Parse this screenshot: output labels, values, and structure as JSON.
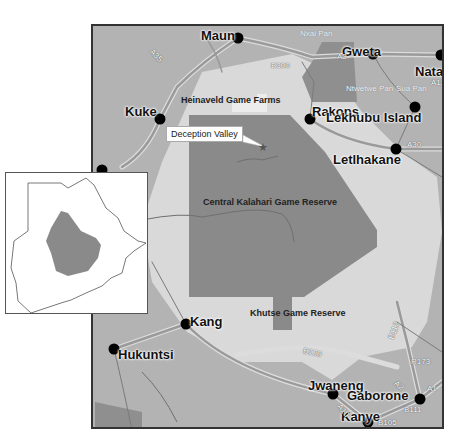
{
  "map": {
    "title": "Central Kalahari region, Botswana",
    "colors": {
      "background": "#b3b3b3",
      "buffer_zone": "#d9d9d9",
      "game_reserve": "#8a8a8a",
      "pan_area": "#8f8f8f",
      "road": "#9a9a9a",
      "road_casing": "#dcdcdc",
      "town_dot": "#000000"
    },
    "towns": [
      {
        "name": "Maun",
        "x": 236,
        "y": 36
      },
      {
        "name": "Gweta",
        "x": 371,
        "y": 52
      },
      {
        "name": "Nata",
        "x": 440,
        "y": 53
      },
      {
        "name": "Kuke",
        "x": 158,
        "y": 117
      },
      {
        "name": "Rakops",
        "x": 308,
        "y": 117
      },
      {
        "name": "Lekhubu Island",
        "x": 413,
        "y": 105
      },
      {
        "name": "Letlhakane",
        "x": 394,
        "y": 147
      },
      {
        "name": "Kang",
        "x": 184,
        "y": 322
      },
      {
        "name": "Hukuntsi",
        "x": 112,
        "y": 347
      },
      {
        "name": "Jwaneng",
        "x": 331,
        "y": 392
      },
      {
        "name": "Gaborone",
        "x": 418,
        "y": 397
      },
      {
        "name": "Kanye",
        "x": 366,
        "y": 420
      }
    ],
    "area_labels": {
      "heinaveld": "Heinaveld Game Farms",
      "ckgr": "Central Kalahari Game Reserve",
      "khutse": "Khutse Game Reserve"
    },
    "pan_labels": {
      "nxai": "Nxai Pan",
      "ntwetwe": "Ntwetwe Pan",
      "sua": "Sua Pan"
    },
    "road_labels": {
      "a35": "A35",
      "b300": "B300",
      "a3": "A3",
      "a33": "A33",
      "a12": "A12",
      "a30": "A30",
      "b120": "B120",
      "b112": "B112",
      "r173": "R173",
      "a2": "A2",
      "a1": "A1",
      "b111": "B111",
      "b105": "B105",
      "a10": "A10"
    },
    "callout": {
      "label": "Deception Valley",
      "marker": "star-icon"
    },
    "inset": {
      "description": "Botswana outline with study area highlighted",
      "country_fill": "#ffffff",
      "highlight_fill": "#8a8a8a"
    }
  }
}
